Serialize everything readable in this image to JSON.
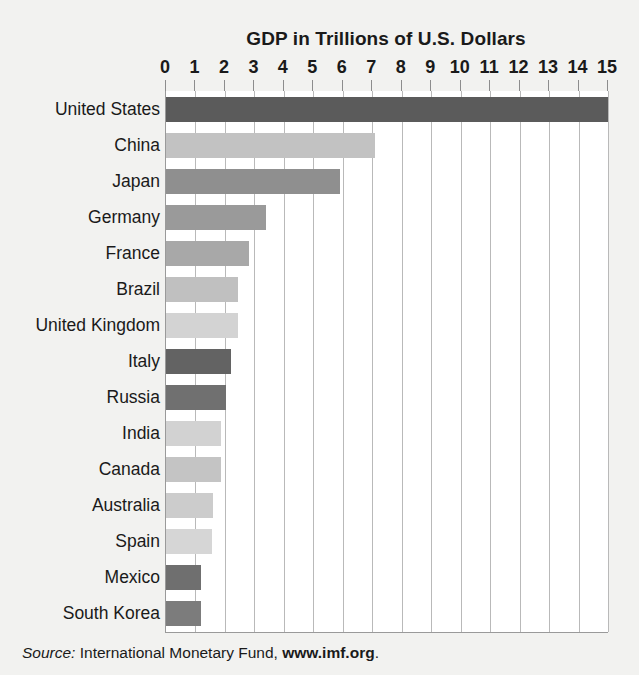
{
  "chart_data": {
    "type": "bar",
    "orientation": "horizontal",
    "title": "GDP in Trillions of U.S. Dollars",
    "xlabel": "",
    "ylabel": "",
    "xlim": [
      0,
      15
    ],
    "xticks": [
      0,
      1,
      2,
      3,
      4,
      5,
      6,
      7,
      8,
      9,
      10,
      11,
      12,
      13,
      14,
      15
    ],
    "xtick_labels": [
      "0",
      "1",
      "2",
      "3",
      "4",
      "5",
      "6",
      "7",
      "8",
      "9",
      "10",
      "11",
      "12",
      "13",
      "14",
      "15"
    ],
    "grid": true,
    "grid_axis": "x",
    "legend": false,
    "categories": [
      "United States",
      "China",
      "Japan",
      "Germany",
      "France",
      "Brazil",
      "United Kingdom",
      "Italy",
      "Russia",
      "India",
      "Canada",
      "Australia",
      "Spain",
      "Mexico",
      "South Korea"
    ],
    "values": [
      15.0,
      7.1,
      5.9,
      3.4,
      2.8,
      2.45,
      2.45,
      2.2,
      2.05,
      1.85,
      1.85,
      1.6,
      1.55,
      1.2,
      1.2
    ],
    "bar_colors": [
      "#5b5b5b",
      "#c2c2c2",
      "#8f8f8f",
      "#9a9a9a",
      "#a8a8a8",
      "#c0c0c0",
      "#d3d3d3",
      "#636363",
      "#707070",
      "#d2d2d2",
      "#c4c4c4",
      "#cccccc",
      "#d6d6d6",
      "#6f6f6f",
      "#7c7c7c"
    ]
  },
  "source": {
    "label": "Source:",
    "text": "International Monetary Fund,",
    "url": "www.imf.org",
    "period": "."
  },
  "colors": {
    "background": "#f2f2f0",
    "plot_background": "#ffffff",
    "gridline": "#b9b9b9",
    "axis": "#9a9a9a",
    "text": "#1a1a1a"
  }
}
